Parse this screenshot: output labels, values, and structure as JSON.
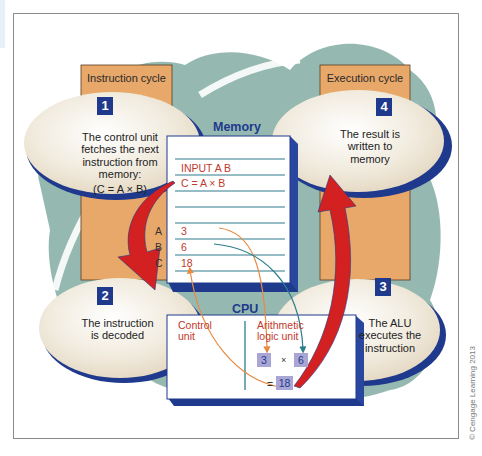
{
  "figure": {
    "credit": "© Cengage Learning 2013"
  },
  "columns": {
    "instruction": {
      "label": "Instruction cycle"
    },
    "execution": {
      "label": "Execution cycle"
    }
  },
  "steps": [
    {
      "number": "1",
      "text_lines": [
        "The control unit",
        "fetches the next",
        "instruction from",
        "memory:",
        "(C = A × B)"
      ]
    },
    {
      "number": "2",
      "text_lines": [
        "The instruction",
        "is decoded"
      ]
    },
    {
      "number": "3",
      "text_lines": [
        "The ALU",
        "executes the",
        "instruction"
      ]
    },
    {
      "number": "4",
      "text_lines": [
        "The result is",
        "written to",
        "memory"
      ]
    }
  ],
  "memory": {
    "title": "Memory",
    "rows": [
      "INPUT A B",
      "C = A × B",
      "",
      "",
      "3",
      "6",
      "18"
    ],
    "registers": [
      "A",
      "B",
      "C"
    ]
  },
  "cpu": {
    "title": "CPU",
    "control_unit_lines": [
      "Control",
      "unit"
    ],
    "alu_lines": [
      "Arithmetic",
      "logic unit"
    ],
    "operand_a": "3",
    "operator": "×",
    "operand_b": "6",
    "equals": "=",
    "result": "18"
  },
  "colors": {
    "teal_blob": "#8fb5ad",
    "orange_column": "#e8a86a",
    "oval_fill": "#efe6d6",
    "navy": "#1f3a8c",
    "red_arrow": "#d32020",
    "memory_text": "#c0392b",
    "teal_line": "#2e7d8c",
    "orange_line": "#e88a40"
  }
}
